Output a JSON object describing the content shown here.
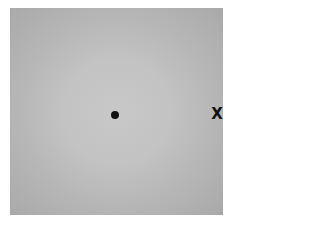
{
  "stimulus": {
    "background": {
      "center_color": "#c8c8c8",
      "edge_color": "#a9a9a9"
    },
    "fixation": {
      "shape": "filled-circle",
      "color": "#111111"
    },
    "target": {
      "glyph": "X",
      "color": "#111111"
    }
  }
}
